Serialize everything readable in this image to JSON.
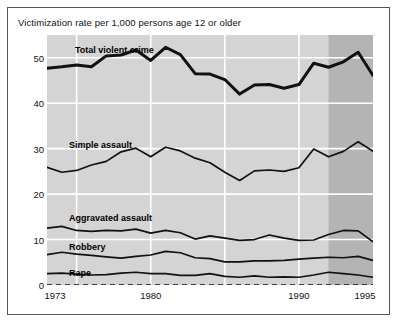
{
  "figure": {
    "title": "Victimization rate per 1,000 persons age 12 or older"
  },
  "axes": {
    "y_ticks": [
      "0",
      "10",
      "20",
      "30",
      "40",
      "50"
    ],
    "x_ticks": [
      "1973",
      "1980",
      "1990",
      "1995"
    ]
  },
  "series_labels": {
    "total_violent_crime": "Total violent crime",
    "simple_assault": "Simple assault",
    "aggravated_assault": "Aggravated assault",
    "robbery": "Robbery",
    "rape": "Rape"
  },
  "colors": {
    "plot_background": "#d4d4d4",
    "plot_background_highlight": "#b4b4b4",
    "gridline": "#ffffff",
    "line": "#111111",
    "frame": "#555555",
    "text": "#111111"
  },
  "chart_data": {
    "type": "line",
    "title": "Victimization rate per 1,000 persons age 12 or older",
    "xlabel": "",
    "ylabel": "",
    "xlim": [
      1973,
      1995
    ],
    "ylim": [
      0,
      55
    ],
    "ytick_values": [
      0,
      10,
      20,
      30,
      40,
      50
    ],
    "xtick_values": [
      1973,
      1980,
      1990,
      1995
    ],
    "gridlines": {
      "horizontal": true,
      "vertical_at": [
        1975,
        1980,
        1985,
        1990
      ]
    },
    "legend": "inline-labels",
    "shaded_region": {
      "from": 1992,
      "to": 1995,
      "note": "redesigned survey period shading"
    },
    "x": [
      1973,
      1974,
      1975,
      1976,
      1977,
      1978,
      1979,
      1980,
      1981,
      1982,
      1983,
      1984,
      1985,
      1986,
      1987,
      1988,
      1989,
      1990,
      1991,
      1992,
      1993,
      1994,
      1995
    ],
    "series": [
      {
        "name": "Total violent crime",
        "values": [
          47.7,
          48.0,
          48.4,
          48.0,
          50.4,
          50.6,
          51.7,
          49.4,
          52.3,
          50.7,
          46.5,
          46.4,
          45.2,
          42.0,
          44.0,
          44.1,
          43.3,
          44.1,
          48.8,
          47.9,
          49.1,
          51.2,
          46.1
        ]
      },
      {
        "name": "Simple assault",
        "values": [
          25.9,
          24.8,
          25.2,
          26.4,
          27.2,
          29.3,
          30.1,
          28.2,
          30.3,
          29.5,
          27.9,
          26.9,
          24.8,
          23.0,
          25.1,
          25.3,
          25.0,
          25.8,
          29.9,
          28.2,
          29.4,
          31.5,
          29.4
        ]
      },
      {
        "name": "Aggravated assault",
        "values": [
          12.5,
          12.9,
          12.0,
          11.8,
          12.0,
          11.9,
          12.3,
          11.4,
          12.0,
          11.5,
          10.1,
          10.8,
          10.3,
          9.8,
          10.0,
          11.0,
          10.3,
          9.8,
          9.9,
          11.1,
          12.0,
          11.9,
          9.5
        ]
      },
      {
        "name": "Robbery",
        "values": [
          6.7,
          7.2,
          6.8,
          6.5,
          6.2,
          5.9,
          6.3,
          6.6,
          7.4,
          7.1,
          6.0,
          5.8,
          5.1,
          5.1,
          5.3,
          5.3,
          5.4,
          5.7,
          5.9,
          6.1,
          6.0,
          6.3,
          5.4
        ]
      },
      {
        "name": "Rape",
        "values": [
          2.5,
          2.6,
          2.4,
          2.2,
          2.3,
          2.6,
          2.8,
          2.5,
          2.5,
          2.1,
          2.1,
          2.5,
          1.9,
          1.7,
          2.0,
          1.7,
          1.8,
          1.7,
          2.2,
          2.8,
          2.5,
          2.2,
          1.7
        ]
      }
    ]
  }
}
